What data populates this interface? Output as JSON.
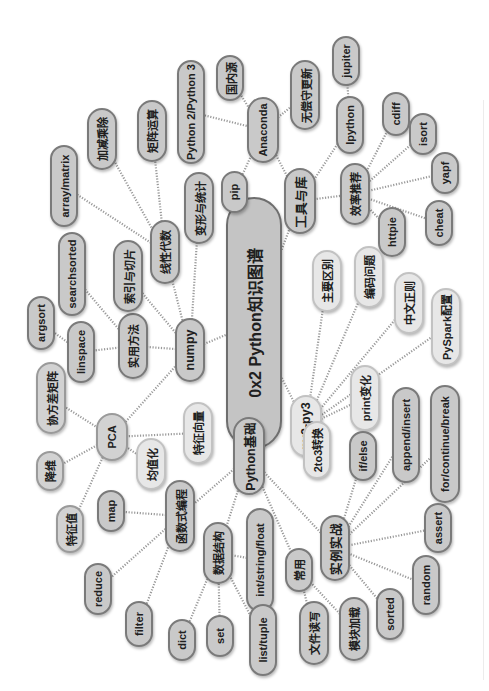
{
  "title": "0x2 Python知识图谱",
  "colors": {
    "background": "#ffffff",
    "node_fill": "#c9c9c9",
    "node_border": "#7a7a7a",
    "light_fill": "#e7e7e7",
    "edge": "#9a9a9a"
  },
  "nodes": [
    {
      "id": "root",
      "label": "0x2 Python知识图谱",
      "x": 226,
      "y": 197,
      "w": 56,
      "h": 252,
      "style": "root"
    },
    {
      "id": "tools",
      "label": "工具与库",
      "x": 284,
      "y": 168,
      "w": 32,
      "h": 66,
      "style": "dark big"
    },
    {
      "id": "anaconda",
      "label": "Anaconda",
      "x": 247,
      "y": 97,
      "w": 32,
      "h": 66,
      "style": "dark"
    },
    {
      "id": "guonei",
      "label": "国内源",
      "x": 216,
      "y": 55,
      "w": 28,
      "h": 46,
      "style": "dark"
    },
    {
      "id": "py23ver",
      "label": "Python 2/Python 3",
      "x": 177,
      "y": 60,
      "w": 28,
      "h": 104,
      "style": "dark"
    },
    {
      "id": "pip",
      "label": "pip",
      "x": 221,
      "y": 171,
      "w": 27,
      "h": 42,
      "style": "dark"
    },
    {
      "id": "wuchang",
      "label": "无偿守更新",
      "x": 290,
      "y": 60,
      "w": 30,
      "h": 70,
      "style": "dark"
    },
    {
      "id": "ipython",
      "label": "Ipython",
      "x": 336,
      "y": 96,
      "w": 28,
      "h": 58,
      "style": "dark"
    },
    {
      "id": "jupiter",
      "label": "jupiter",
      "x": 332,
      "y": 36,
      "w": 28,
      "h": 50,
      "style": "dark"
    },
    {
      "id": "xiaolv",
      "label": "效率推荐",
      "x": 340,
      "y": 163,
      "w": 30,
      "h": 62,
      "style": "dark"
    },
    {
      "id": "cdiff",
      "label": "cdiff",
      "x": 382,
      "y": 92,
      "w": 28,
      "h": 44,
      "style": "dark"
    },
    {
      "id": "isort",
      "label": "isort",
      "x": 409,
      "y": 113,
      "w": 28,
      "h": 42,
      "style": "dark"
    },
    {
      "id": "yapf",
      "label": "yapf",
      "x": 431,
      "y": 152,
      "w": 28,
      "h": 42,
      "style": "dark"
    },
    {
      "id": "cheat",
      "label": "cheat",
      "x": 425,
      "y": 200,
      "w": 28,
      "h": 46,
      "style": "dark"
    },
    {
      "id": "httpie",
      "label": "httpie",
      "x": 378,
      "y": 207,
      "w": 28,
      "h": 50,
      "style": "dark"
    },
    {
      "id": "numpy",
      "label": "numpy",
      "x": 175,
      "y": 318,
      "w": 30,
      "h": 64,
      "style": "dark big"
    },
    {
      "id": "xianxing",
      "label": "线性代数",
      "x": 150,
      "y": 220,
      "w": 30,
      "h": 64,
      "style": "dark"
    },
    {
      "id": "bianxing",
      "label": "变形与统计",
      "x": 184,
      "y": 172,
      "w": 30,
      "h": 72,
      "style": "dark"
    },
    {
      "id": "juzhen",
      "label": "矩阵运算",
      "x": 137,
      "y": 100,
      "w": 30,
      "h": 62,
      "style": "dark"
    },
    {
      "id": "jiajian",
      "label": "加减乘除",
      "x": 87,
      "y": 108,
      "w": 30,
      "h": 62,
      "style": "dark"
    },
    {
      "id": "arraymatrix",
      "label": "array/matrix",
      "x": 50,
      "y": 145,
      "w": 28,
      "h": 82,
      "style": "dark"
    },
    {
      "id": "shiyong",
      "label": "实用方法",
      "x": 118,
      "y": 313,
      "w": 30,
      "h": 66,
      "style": "dark"
    },
    {
      "id": "suoyin",
      "label": "索引与切片",
      "x": 113,
      "y": 240,
      "w": 30,
      "h": 72,
      "style": "dark"
    },
    {
      "id": "searchsorted",
      "label": "searchsorted",
      "x": 58,
      "y": 232,
      "w": 28,
      "h": 84,
      "style": "dark"
    },
    {
      "id": "argsort",
      "label": "argsort",
      "x": 27,
      "y": 296,
      "w": 28,
      "h": 54,
      "style": "dark"
    },
    {
      "id": "linspace",
      "label": "linspace",
      "x": 67,
      "y": 321,
      "w": 28,
      "h": 62,
      "style": "dark"
    },
    {
      "id": "pca",
      "label": "PCA",
      "x": 96,
      "y": 413,
      "w": 32,
      "h": 48,
      "style": "mid"
    },
    {
      "id": "xiefangcha",
      "label": "协方差矩阵",
      "x": 36,
      "y": 362,
      "w": 30,
      "h": 72,
      "style": "mid"
    },
    {
      "id": "tezhengxl",
      "label": "特征向量",
      "x": 183,
      "y": 402,
      "w": 30,
      "h": 62,
      "style": "light"
    },
    {
      "id": "junzhi",
      "label": "均值化",
      "x": 136,
      "y": 438,
      "w": 30,
      "h": 52,
      "style": "light"
    },
    {
      "id": "jiangwei",
      "label": "降维",
      "x": 36,
      "y": 451,
      "w": 28,
      "h": 40,
      "style": "mid"
    },
    {
      "id": "tezhengzhi",
      "label": "特征值",
      "x": 56,
      "y": 505,
      "w": 28,
      "h": 48,
      "style": "mid"
    },
    {
      "id": "py2py3",
      "label": "py2-py3",
      "x": 290,
      "y": 395,
      "w": 32,
      "h": 62,
      "style": "light big"
    },
    {
      "id": "zhuyao",
      "label": "主要区别",
      "x": 312,
      "y": 250,
      "w": 30,
      "h": 62,
      "style": "light"
    },
    {
      "id": "bianma",
      "label": "编码问题",
      "x": 354,
      "y": 246,
      "w": 30,
      "h": 62,
      "style": "light"
    },
    {
      "id": "zhongwen",
      "label": "中文正则",
      "x": 394,
      "y": 272,
      "w": 30,
      "h": 62,
      "style": "light"
    },
    {
      "id": "pyspark",
      "label": "PySpark配置",
      "x": 431,
      "y": 288,
      "w": 30,
      "h": 78,
      "style": "light"
    },
    {
      "id": "printbh",
      "label": "print变化",
      "x": 350,
      "y": 365,
      "w": 30,
      "h": 66,
      "style": "light"
    },
    {
      "id": "2to3",
      "label": "2to3转换",
      "x": 303,
      "y": 421,
      "w": 28,
      "h": 58,
      "style": "light"
    },
    {
      "id": "pybase",
      "label": "Python基础",
      "x": 233,
      "y": 417,
      "w": 32,
      "h": 78,
      "style": "dark big"
    },
    {
      "id": "hanshu",
      "label": "函数式编程",
      "x": 165,
      "y": 480,
      "w": 30,
      "h": 72,
      "style": "dark"
    },
    {
      "id": "map",
      "label": "map",
      "x": 97,
      "y": 490,
      "w": 28,
      "h": 42,
      "style": "dark"
    },
    {
      "id": "reduce",
      "label": "reduce",
      "x": 84,
      "y": 563,
      "w": 28,
      "h": 52,
      "style": "dark"
    },
    {
      "id": "filter",
      "label": "filter",
      "x": 125,
      "y": 601,
      "w": 28,
      "h": 46,
      "style": "dark"
    },
    {
      "id": "shuju",
      "label": "数据结构",
      "x": 203,
      "y": 522,
      "w": 30,
      "h": 62,
      "style": "dark"
    },
    {
      "id": "dict",
      "label": "dict",
      "x": 168,
      "y": 619,
      "w": 28,
      "h": 42,
      "style": "dark"
    },
    {
      "id": "set",
      "label": "set",
      "x": 206,
      "y": 615,
      "w": 28,
      "h": 42,
      "style": "dark"
    },
    {
      "id": "intstr",
      "label": "int/string/float",
      "x": 246,
      "y": 508,
      "w": 28,
      "h": 104,
      "style": "dark"
    },
    {
      "id": "listtuple",
      "label": "list/tuple",
      "x": 249,
      "y": 604,
      "w": 28,
      "h": 72,
      "style": "dark"
    },
    {
      "id": "changyong",
      "label": "常用",
      "x": 285,
      "y": 548,
      "w": 28,
      "h": 44,
      "style": "dark"
    },
    {
      "id": "wenjian",
      "label": "文件读写",
      "x": 299,
      "y": 601,
      "w": 30,
      "h": 64,
      "style": "dark"
    },
    {
      "id": "mokuai",
      "label": "模块加载",
      "x": 339,
      "y": 597,
      "w": 30,
      "h": 64,
      "style": "dark"
    },
    {
      "id": "shili",
      "label": "实例实战",
      "x": 320,
      "y": 515,
      "w": 30,
      "h": 66,
      "style": "dark big"
    },
    {
      "id": "ifelse",
      "label": "if/else",
      "x": 349,
      "y": 431,
      "w": 28,
      "h": 50,
      "style": "dark"
    },
    {
      "id": "append",
      "label": "append/insert",
      "x": 392,
      "y": 387,
      "w": 28,
      "h": 96,
      "style": "dark"
    },
    {
      "id": "forcont",
      "label": "for/continue/break",
      "x": 430,
      "y": 385,
      "w": 30,
      "h": 118,
      "style": "dark"
    },
    {
      "id": "assert",
      "label": "assert",
      "x": 424,
      "y": 503,
      "w": 28,
      "h": 50,
      "style": "dark"
    },
    {
      "id": "random",
      "label": "random",
      "x": 412,
      "y": 555,
      "w": 28,
      "h": 60,
      "style": "dark"
    },
    {
      "id": "sorted",
      "label": "sorted",
      "x": 376,
      "y": 588,
      "w": 28,
      "h": 52,
      "style": "dark"
    }
  ],
  "edges": [
    [
      "root",
      "tools"
    ],
    [
      "tools",
      "anaconda"
    ],
    [
      "anaconda",
      "guonei"
    ],
    [
      "anaconda",
      "py23ver"
    ],
    [
      "anaconda",
      "pip"
    ],
    [
      "anaconda",
      "wuchang"
    ],
    [
      "tools",
      "ipython"
    ],
    [
      "ipython",
      "jupiter"
    ],
    [
      "tools",
      "xiaolv"
    ],
    [
      "xiaolv",
      "cdiff"
    ],
    [
      "xiaolv",
      "isort"
    ],
    [
      "xiaolv",
      "yapf"
    ],
    [
      "xiaolv",
      "cheat"
    ],
    [
      "xiaolv",
      "httpie"
    ],
    [
      "root",
      "numpy"
    ],
    [
      "numpy",
      "xianxing"
    ],
    [
      "numpy",
      "bianxing"
    ],
    [
      "xianxing",
      "juzhen"
    ],
    [
      "xianxing",
      "jiajian"
    ],
    [
      "xianxing",
      "arraymatrix"
    ],
    [
      "numpy",
      "shiyong"
    ],
    [
      "numpy",
      "suoyin"
    ],
    [
      "shiyong",
      "searchsorted"
    ],
    [
      "shiyong",
      "linspace"
    ],
    [
      "linspace",
      "argsort"
    ],
    [
      "numpy",
      "pca"
    ],
    [
      "pca",
      "xiefangcha"
    ],
    [
      "pca",
      "tezhengxl"
    ],
    [
      "pca",
      "junzhi"
    ],
    [
      "pca",
      "jiangwei"
    ],
    [
      "pca",
      "tezhengzhi"
    ],
    [
      "root",
      "py2py3"
    ],
    [
      "py2py3",
      "zhuyao"
    ],
    [
      "py2py3",
      "bianma"
    ],
    [
      "py2py3",
      "zhongwen"
    ],
    [
      "py2py3",
      "pyspark"
    ],
    [
      "py2py3",
      "printbh"
    ],
    [
      "py2py3",
      "2to3"
    ],
    [
      "root",
      "pybase"
    ],
    [
      "pybase",
      "hanshu"
    ],
    [
      "hanshu",
      "map"
    ],
    [
      "hanshu",
      "reduce"
    ],
    [
      "hanshu",
      "filter"
    ],
    [
      "pybase",
      "shuju"
    ],
    [
      "shuju",
      "dict"
    ],
    [
      "shuju",
      "set"
    ],
    [
      "shuju",
      "intstr"
    ],
    [
      "shuju",
      "listtuple"
    ],
    [
      "pybase",
      "changyong"
    ],
    [
      "changyong",
      "wenjian"
    ],
    [
      "changyong",
      "mokuai"
    ],
    [
      "pybase",
      "shili"
    ],
    [
      "shili",
      "ifelse"
    ],
    [
      "shili",
      "append"
    ],
    [
      "shili",
      "forcont"
    ],
    [
      "shili",
      "assert"
    ],
    [
      "shili",
      "random"
    ],
    [
      "shili",
      "sorted"
    ]
  ]
}
